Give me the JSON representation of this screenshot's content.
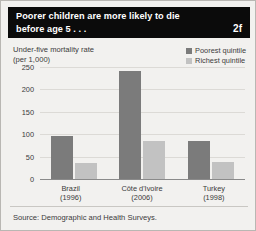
{
  "header": {
    "title": "Poorer children are more likely to die before age 5 . . .",
    "badge": "2f"
  },
  "footer": {
    "source": "Source: Demographic and Health Surveys."
  },
  "legend": {
    "position": "top-right",
    "entries": [
      {
        "label": "Poorest quintile",
        "color": "#7b7b7b",
        "icon": "square-swatch-icon"
      },
      {
        "label": "Richest quintile",
        "color": "#c2c2c2",
        "icon": "square-swatch-icon"
      }
    ]
  },
  "chart_data": {
    "type": "bar",
    "title": "Poorer children are more likely to die before age 5 . . .",
    "xlabel": "",
    "ylabel": "Under-five mortality rate (per 1,000)",
    "ylabel_line1": "Under-five mortality rate",
    "ylabel_line2": "(per 1,000)",
    "categories": [
      "Brazil (1996)",
      "Côte d'Ivoire (2006)",
      "Turkey (1998)"
    ],
    "category_lines": [
      {
        "name": "Brazil",
        "year": "(1996)"
      },
      {
        "name": "Côte d'Ivoire",
        "year": "(2006)"
      },
      {
        "name": "Turkey",
        "year": "(1998)"
      }
    ],
    "series": [
      {
        "name": "Poorest quintile",
        "color": "#7b7b7b",
        "values": [
          95,
          240,
          85
        ]
      },
      {
        "name": "Richest quintile",
        "color": "#c2c2c2",
        "values": [
          35,
          85,
          38
        ]
      }
    ],
    "ylim": [
      0,
      250
    ],
    "yticks": [
      250,
      200,
      150,
      100,
      50,
      0
    ],
    "ytick_labels": [
      "250",
      "200",
      "150",
      "100",
      "50",
      "0"
    ],
    "grid": true,
    "grid_axis": "y",
    "legend_position": "top-right",
    "source": "Source: Demographic and Health Surveys."
  }
}
